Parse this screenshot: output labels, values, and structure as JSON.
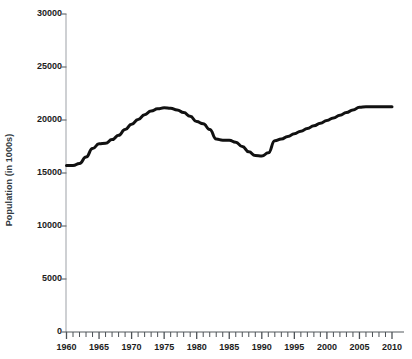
{
  "chart_data": {
    "type": "line",
    "title": "",
    "xlabel": "",
    "ylabel": "Population (in 1000s)",
    "xlim": [
      1960,
      2010
    ],
    "ylim": [
      0,
      30000
    ],
    "grid": false,
    "legend": "none",
    "y_ticks": [
      30000,
      25000,
      20000,
      15000,
      10000,
      5000,
      0
    ],
    "y_tick_labels": [
      "30000",
      "25000",
      "20000",
      "15000",
      "10000",
      "5000",
      "0"
    ],
    "x_ticks": [
      1960,
      1965,
      1970,
      1975,
      1980,
      1985,
      1990,
      1995,
      2000,
      2005,
      2010
    ],
    "x_tick_labels": [
      "1960",
      "1965",
      "1970",
      "1975",
      "1980",
      "1985",
      "1990",
      "1995",
      "2000",
      "2005",
      "2010"
    ],
    "x_minor_tick_step": 1,
    "line_color": "#111111",
    "line_width": 3,
    "series": [
      {
        "name": "Population",
        "x": [
          1960,
          1961,
          1962,
          1963,
          1964,
          1965,
          1966,
          1967,
          1968,
          1969,
          1970,
          1971,
          1972,
          1973,
          1974,
          1975,
          1976,
          1977,
          1978,
          1979,
          1980,
          1981,
          1982,
          1983,
          1984,
          1985,
          1986,
          1987,
          1988,
          1989,
          1990,
          1991,
          1992,
          1993,
          1994,
          1995,
          1996,
          1997,
          1998,
          1999,
          2000,
          2001,
          2002,
          2003,
          2004,
          2005,
          2006,
          2007,
          2008,
          2009,
          2010
        ],
        "values": [
          15700,
          15700,
          15900,
          16500,
          17300,
          17750,
          17800,
          18150,
          18550,
          19100,
          19600,
          20050,
          20500,
          20850,
          21050,
          21150,
          21100,
          20950,
          20700,
          20350,
          19850,
          19650,
          19100,
          18200,
          18100,
          18100,
          17900,
          17500,
          17000,
          16650,
          16600,
          16900,
          18050,
          18200,
          18450,
          18700,
          18950,
          19200,
          19450,
          19700,
          19950,
          20200,
          20450,
          20700,
          20950,
          21200,
          21250,
          21250,
          21250,
          21250,
          21250
        ]
      }
    ]
  }
}
